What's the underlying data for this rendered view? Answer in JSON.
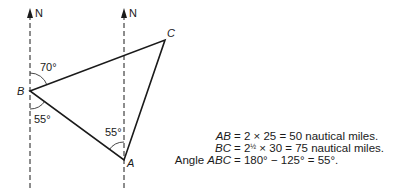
{
  "diagram": {
    "north_labels": [
      "N",
      "N"
    ],
    "vertices": {
      "A": {
        "label": "A",
        "x": 124,
        "y": 160
      },
      "B": {
        "label": "B",
        "x": 30,
        "y": 91
      },
      "C": {
        "label": "C",
        "x": 165,
        "y": 40
      }
    },
    "angles": {
      "B_north_to_C": "70°",
      "B_south_to_A": "55°",
      "A_north_to_B": "55°"
    },
    "line_color": "#1a1a1a"
  },
  "equations": [
    {
      "lhs_prefix": "",
      "lhs": "AB",
      "rhs": "= 2 × 25 = 50 nautical miles."
    },
    {
      "lhs_prefix": "",
      "lhs": "BC",
      "rhs_pre": "= 2",
      "rhs_frac": "1/2",
      "rhs_post": " × 30 = 75 nautical miles."
    },
    {
      "lhs_prefix": "Angle ",
      "lhs": "ABC",
      "rhs": "= 180° − 125° = 55°."
    }
  ]
}
